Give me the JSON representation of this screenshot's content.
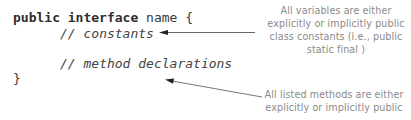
{
  "code": {
    "line1": {
      "keyword_public": "public",
      "keyword_interface": "interface",
      "name": "name {"
    },
    "line2": "// constants",
    "line3": "// method declarations",
    "line4": "}"
  },
  "annotations": {
    "constants_note": {
      "lines": [
        "All variables are  either",
        "explicitly or implicitly public",
        "class constants (i.e., public",
        "static final )"
      ]
    },
    "methods_note": {
      "lines": [
        "All listed methods are  either",
        "explicitly or implicitly public"
      ]
    }
  },
  "colors": {
    "code_text": "#3a3a3a",
    "annotation_text": "#8a8a8a",
    "arrow": "#555555"
  }
}
